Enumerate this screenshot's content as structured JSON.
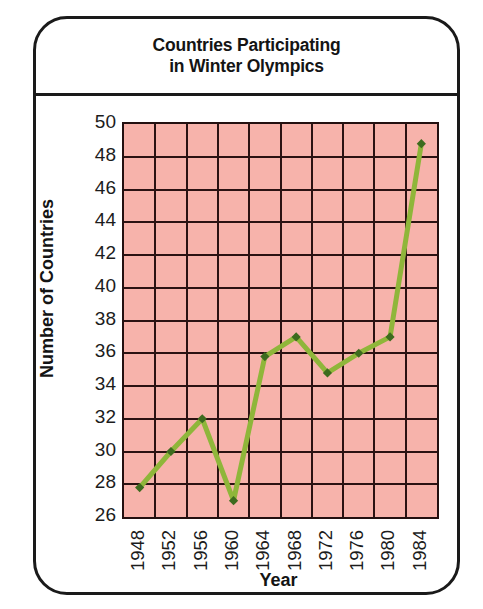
{
  "figure": {
    "frame_style": "rounded-black-border",
    "background_color": "#ffffff"
  },
  "title": {
    "line1": "Countries Participating",
    "line2": "in Winter Olympics"
  },
  "axis": {
    "y_label": "Number of Countries",
    "x_label": "Year"
  },
  "colors": {
    "plot_background": "#f7b3ab",
    "grid": "#2b1212",
    "line": "#8fb63a",
    "marker": "#3d6b1e",
    "frame": "#1a1a1a",
    "text": "#141414"
  },
  "chart_data": {
    "type": "line",
    "title": "Countries Participating in Winter Olympics",
    "xlabel": "Year",
    "ylabel": "Number of Countries",
    "categories": [
      "1948",
      "1952",
      "1956",
      "1960",
      "1964",
      "1968",
      "1972",
      "1976",
      "1980",
      "1984"
    ],
    "values": [
      27.8,
      30,
      32,
      27,
      35.8,
      37,
      34.8,
      36,
      37,
      48.8
    ],
    "series": [
      {
        "name": "Number of Countries",
        "values": [
          27.8,
          30,
          32,
          27,
          35.8,
          37,
          34.8,
          36,
          37,
          48.8
        ]
      }
    ],
    "ylim": [
      26,
      50
    ],
    "ytick_labels": [
      "50",
      "48",
      "46",
      "44",
      "42",
      "40",
      "38",
      "36",
      "34",
      "32",
      "30",
      "28",
      "26"
    ],
    "ytick_values": [
      50,
      48,
      46,
      44,
      42,
      40,
      38,
      36,
      34,
      32,
      30,
      28,
      26
    ],
    "ytick_step": 2,
    "xtick_labels": [
      "1948",
      "1952",
      "1956",
      "1960",
      "1964",
      "1968",
      "1972",
      "1976",
      "1980",
      "1984"
    ],
    "xtick_rotation": 90,
    "grid": true,
    "legend": false,
    "marker": "diamond"
  }
}
